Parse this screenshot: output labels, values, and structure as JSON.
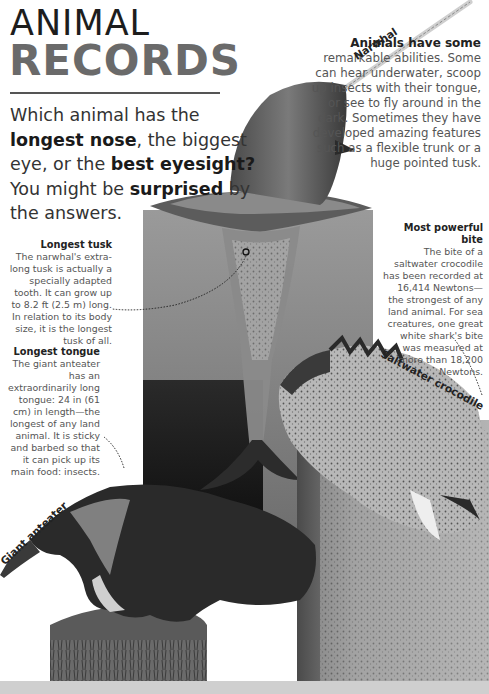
{
  "header": {
    "title_line1": "ANIMAL",
    "title_line2": "RECORDS"
  },
  "intro": {
    "parts": [
      {
        "text": "Which animal has the ",
        "bold": false
      },
      {
        "text": "longest nose",
        "bold": true
      },
      {
        "text": ", the biggest eye, or the ",
        "bold": false
      },
      {
        "text": "best eyesight?",
        "bold": true
      },
      {
        "text": " You might be ",
        "bold": false
      },
      {
        "text": "surprised",
        "bold": true
      },
      {
        "text": " by the answers.",
        "bold": false
      }
    ]
  },
  "sidebar_intro": {
    "heading": "Animals have some",
    "body": "remarkable abilities. Some can hear underwater, scoop up insects with their tongue, or see to fly around in the dark. Sometimes they have developed amazing features such as a flexible trunk or a huge pointed tusk."
  },
  "facts": {
    "tusk": {
      "heading": "Longest tusk",
      "body": "The narwhal's extra-long tusk is actually a specially adapted tooth. It can grow up to 8.2 ft (2.5 m) long. In relation to its body size, it is the longest tusk of all."
    },
    "tongue": {
      "heading": "Longest tongue",
      "body": "The giant anteater has an extraordinarily long tongue: 24 in (61 cm) in length—the longest of any land animal. It is sticky and barbed so that it can pick up its main food: insects."
    },
    "bite": {
      "heading": "Most powerful bite",
      "body": "The bite of a saltwater crocodile has been recorded at 16,414 Newtons— the strongest of any land animal. For sea creatures, one great white shark's bite was measured at more than 18,200 Newtons."
    }
  },
  "animal_labels": {
    "narwhal": "Narwhal",
    "anteater": "Giant anteater",
    "crocodile": "Saltwater crocodile"
  },
  "colors": {
    "title_dark": "#1d1d1d",
    "title_grey": "#6a6a6a",
    "water": "#8a8a8a",
    "floor": "#cfcfcf"
  }
}
